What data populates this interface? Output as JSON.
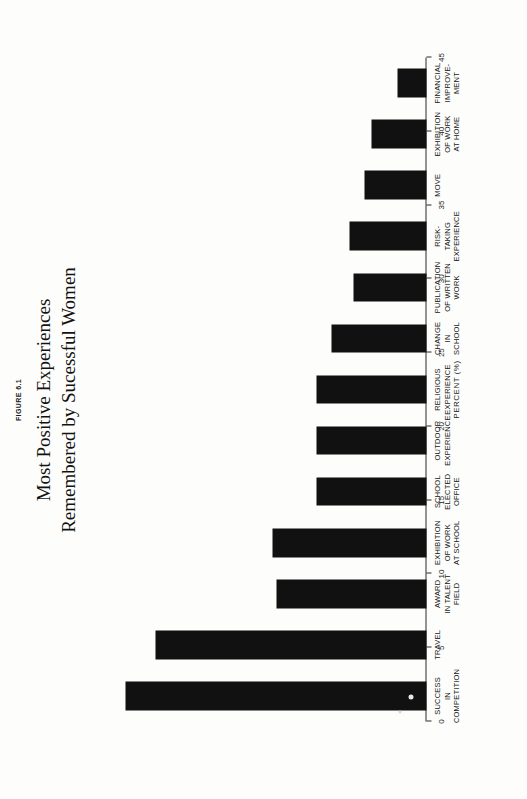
{
  "figure": {
    "label": "FIGURE 6.1",
    "title_line1": "Most Positive Experiences",
    "title_line2": "Remembered by Sucessful Women"
  },
  "chart_data": {
    "type": "bar",
    "orientation": "vertical",
    "title": "Most Positive Experiences Remembered by Sucessful Women",
    "xlabel": "",
    "ylabel": "PERCENT (%)",
    "ylim": [
      0,
      45
    ],
    "yticks": [
      0,
      5,
      10,
      15,
      20,
      25,
      30,
      35,
      40,
      45
    ],
    "ytick_labels": [
      "0",
      "5",
      "10",
      "15",
      "20",
      "25",
      "30",
      "35",
      "40",
      "45"
    ],
    "grid": false,
    "legend": null,
    "bar_color": "#111111",
    "categories": [
      "SUCCESS\nIN\nCOMPETITION",
      "TRAVEL",
      "AWARD\nIN TALENT\nFIELD",
      "EXHIBITION\nOF WORK\nAT SCHOOL",
      "SCHOOL\nELECTED\nOFFICE",
      "OUTDOOR\nEXPERIENCE",
      "RELIGIOUS\nEXPERIENCE",
      "CHANGE\nIN\nSCHOOL",
      "PUBLICATION\nOF WRITTEN\nWORK",
      "RISK-\nTAKING\nEXPERIENCE",
      "MOVE",
      "EXHIBITION\nOF WORK\nAT HOME",
      "FINANCIAL\nIMPROVE-\nMENT"
    ],
    "values": [
      41,
      37,
      20.5,
      21,
      15,
      15,
      15,
      13,
      10,
      10.5,
      8.5,
      7.5,
      4
    ]
  }
}
